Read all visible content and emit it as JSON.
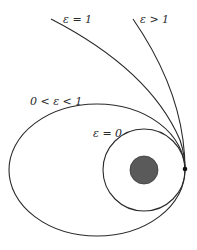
{
  "diagram": {
    "labels": {
      "hyperbola": "ε > 1",
      "parabola": "ε = 1",
      "ellipse": "0 < ε < 1",
      "circle": "ε = 0"
    },
    "colors": {
      "stroke": "#2a2a2a",
      "planet_fill": "#5a5a5a",
      "background": "#ffffff"
    },
    "elements": [
      {
        "type": "hyperbola",
        "eccentricity": "ε > 1"
      },
      {
        "type": "parabola",
        "eccentricity": "ε = 1"
      },
      {
        "type": "ellipse",
        "eccentricity": "0 < ε < 1"
      },
      {
        "type": "circle",
        "eccentricity": "ε = 0"
      },
      {
        "type": "central-body"
      },
      {
        "type": "periapsis-point"
      }
    ]
  }
}
